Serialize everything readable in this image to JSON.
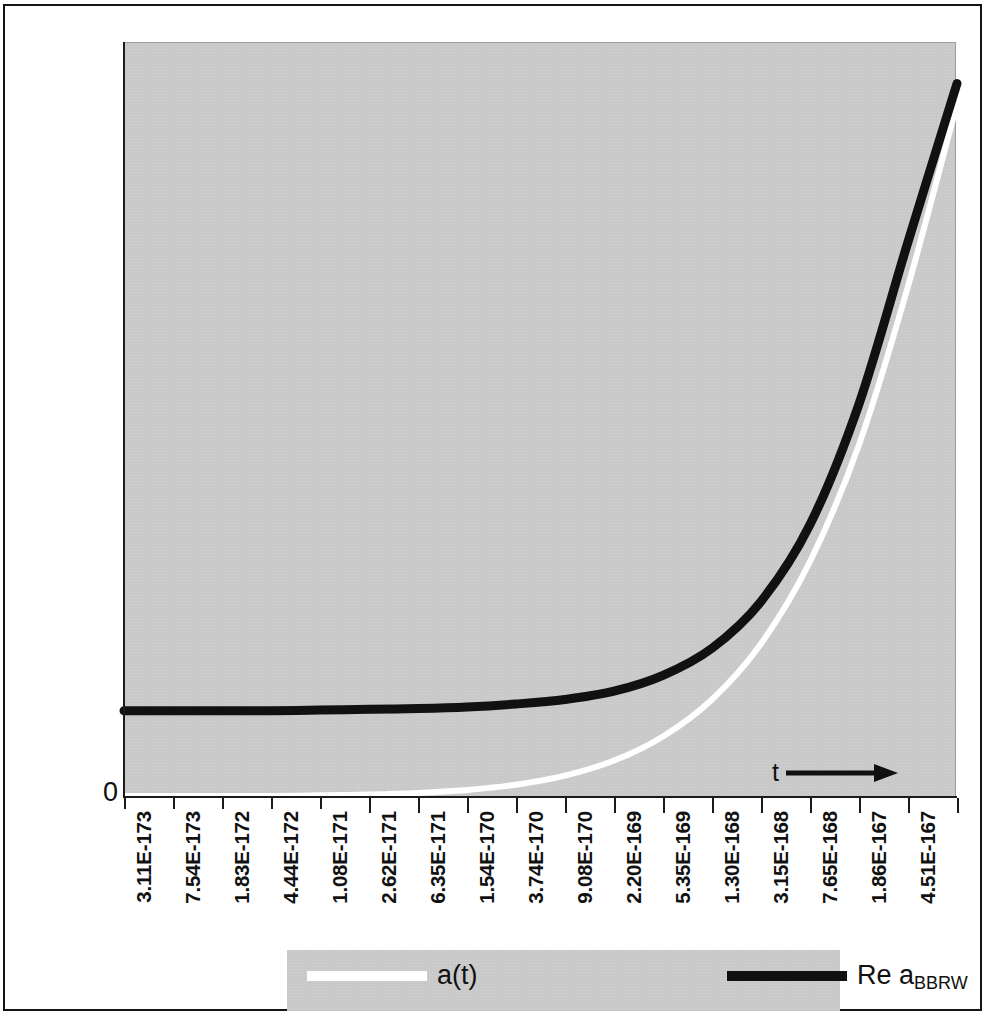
{
  "figure": {
    "axis_zero_label": "0",
    "axis_arrow_label": "t",
    "arrow_icon": "right-arrow-icon",
    "panel_color": "#c9c9c9",
    "page_background": "#ffffff"
  },
  "legend": {
    "entries": [
      {
        "label": "a(t)",
        "label_sub": "",
        "color": "#ffffff",
        "swatch": "white-line-swatch"
      },
      {
        "label": "Re a",
        "label_sub": "BBRW",
        "color": "#111111",
        "swatch": "black-line-swatch"
      }
    ]
  },
  "chart_data": {
    "type": "line",
    "title": "",
    "subtitle": "",
    "xlabel": "t",
    "ylabel": "",
    "grid": false,
    "legend_position": "bottom",
    "x_tick_labels": [
      "3.11E-173",
      "7.54E-173",
      "1.83E-172",
      "4.44E-172",
      "1.08E-171",
      "2.62E-171",
      "6.35E-171",
      "1.54E-170",
      "3.74E-170",
      "9.08E-170",
      "2.20E-169",
      "5.35E-169",
      "1.30E-168",
      "3.15E-168",
      "7.65E-168",
      "1.86E-167",
      "4.51E-167"
    ],
    "x_index": [
      0,
      1,
      2,
      3,
      4,
      5,
      6,
      7,
      8,
      9,
      10,
      11,
      12,
      13,
      14,
      15,
      16,
      17
    ],
    "y_tick_labels": [
      "0"
    ],
    "ylim": [
      0,
      1
    ],
    "series": [
      {
        "name": "Re a",
        "name_sub": "BBRW",
        "color": "#111111",
        "linewidth": 9,
        "values": [
          0.113,
          0.113,
          0.113,
          0.113,
          0.114,
          0.115,
          0.116,
          0.118,
          0.122,
          0.128,
          0.139,
          0.16,
          0.196,
          0.258,
          0.36,
          0.52,
          0.735,
          0.945
        ]
      },
      {
        "name": "a(t)",
        "name_sub": "",
        "color": "#ffffff",
        "linewidth": 6,
        "values": [
          0.0,
          0.0,
          0.0,
          0.0,
          0.001,
          0.002,
          0.004,
          0.008,
          0.015,
          0.027,
          0.047,
          0.079,
          0.128,
          0.202,
          0.311,
          0.466,
          0.676,
          0.918
        ]
      }
    ]
  }
}
